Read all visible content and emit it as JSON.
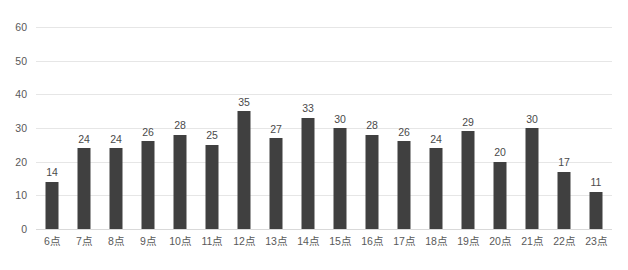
{
  "chart_data": {
    "type": "bar",
    "title": "",
    "subtitle": "",
    "xlabel": "",
    "ylabel": "",
    "categories": [
      "6点",
      "7点",
      "8点",
      "9点",
      "10点",
      "11点",
      "12点",
      "13点",
      "14点",
      "15点",
      "16点",
      "17点",
      "18点",
      "19点",
      "20点",
      "21点",
      "22点",
      "23点"
    ],
    "values": [
      14,
      24,
      24,
      26,
      28,
      25,
      35,
      27,
      33,
      30,
      28,
      26,
      24,
      29,
      20,
      30,
      17,
      11
    ],
    "data_labels": [
      "14",
      "24",
      "24",
      "26",
      "28",
      "25",
      "35",
      "27",
      "33",
      "30",
      "28",
      "26",
      "24",
      "29",
      "20",
      "30",
      "17",
      "11"
    ],
    "ylim": [
      0,
      60
    ],
    "yticks": [
      0,
      10,
      20,
      30,
      40,
      50,
      60
    ],
    "ytick_labels": [
      "0",
      "10",
      "20",
      "30",
      "40",
      "50",
      "60"
    ],
    "grid": true,
    "grid_axis": "y",
    "legend": false,
    "legend_position": "none",
    "series": [
      {
        "name": "",
        "values": [
          14,
          24,
          24,
          26,
          28,
          25,
          35,
          27,
          33,
          30,
          28,
          26,
          24,
          29,
          20,
          30,
          17,
          11
        ]
      }
    ]
  },
  "style": {
    "bar_color": "#404040",
    "gridline_color": "#e6e6e6",
    "axis_line_color": "#d9d9d9",
    "tick_label_color": "#595959",
    "data_label_color": "#4a4a4a",
    "background_color": "#ffffff"
  }
}
